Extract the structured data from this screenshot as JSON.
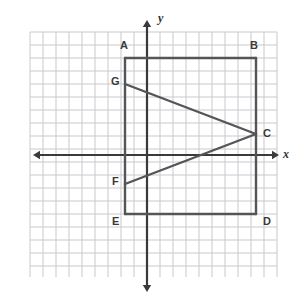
{
  "figure": {
    "background_color": "#ffffff",
    "grid": {
      "color": "#c9c9ce",
      "cell_size": 13,
      "left": 30,
      "top": 32,
      "right": 277,
      "bottom": 277,
      "columns": 19,
      "rows": 19
    },
    "axes": {
      "color": "#3a3a3a",
      "origin_x": 147,
      "origin_y": 155,
      "x_axis": {
        "start_x": 33,
        "end_x": 279,
        "y": 155,
        "label": "x",
        "label_x": 283,
        "label_y": 148
      },
      "y_axis": {
        "x": 147,
        "start_y": 20,
        "end_y": 292,
        "label": "y",
        "label_x": 158,
        "label_y": 12
      }
    },
    "shape": {
      "stroke_color": "#555558",
      "stroke_width": 2.4,
      "rectangle_name": "ABDE",
      "chevron_name": "G-C-F"
    },
    "points": [
      {
        "id": "A",
        "label": "A",
        "px": 125,
        "py": 58,
        "label_x": 120,
        "label_y": 40
      },
      {
        "id": "B",
        "label": "B",
        "px": 256,
        "py": 58,
        "label_x": 250,
        "label_y": 40
      },
      {
        "id": "C",
        "label": "C",
        "px": 256,
        "py": 134,
        "label_x": 263,
        "label_y": 128
      },
      {
        "id": "D",
        "label": "D",
        "px": 256,
        "py": 214,
        "label_x": 263,
        "label_y": 216
      },
      {
        "id": "E",
        "label": "E",
        "px": 125,
        "py": 214,
        "label_x": 112,
        "label_y": 216
      },
      {
        "id": "F",
        "label": "F",
        "px": 125,
        "py": 184,
        "label_x": 112,
        "label_y": 176
      },
      {
        "id": "G",
        "label": "G",
        "px": 125,
        "py": 84,
        "label_x": 111,
        "label_y": 76
      }
    ],
    "segments": [
      {
        "name": "side-AB",
        "from": "A",
        "to": "B"
      },
      {
        "name": "side-BD",
        "from": "B",
        "to": "D"
      },
      {
        "name": "side-DE",
        "from": "D",
        "to": "E"
      },
      {
        "name": "side-EA",
        "from": "E",
        "to": "A"
      },
      {
        "name": "chevron-GC",
        "from": "G",
        "to": "C"
      },
      {
        "name": "chevron-CF",
        "from": "C",
        "to": "F"
      }
    ]
  }
}
